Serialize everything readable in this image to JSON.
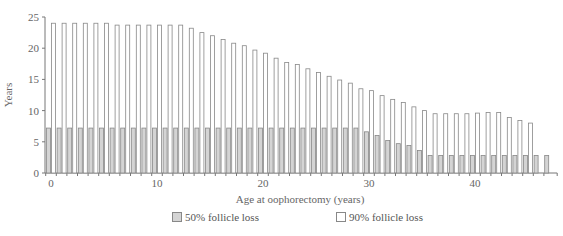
{
  "chart_data": {
    "type": "bar",
    "title": "",
    "xlabel": "Age at oophorectomy (years)",
    "ylabel": "Years",
    "ylim": [
      0,
      25
    ],
    "yticks": [
      0,
      5,
      10,
      15,
      20,
      25
    ],
    "xticks_labeled": [
      0,
      10,
      20,
      30,
      40
    ],
    "grid": false,
    "legend_position": "bottom",
    "categories": [
      0,
      1,
      2,
      3,
      4,
      5,
      6,
      7,
      8,
      9,
      10,
      11,
      12,
      13,
      14,
      15,
      16,
      17,
      18,
      19,
      20,
      21,
      22,
      23,
      24,
      25,
      26,
      27,
      28,
      29,
      30,
      31,
      32,
      33,
      34,
      35,
      36,
      37,
      38,
      39,
      40,
      41,
      42,
      43,
      44,
      45,
      46,
      47
    ],
    "series": [
      {
        "name": "50% follicle loss",
        "color": "#d4d4d4",
        "values": [
          7.2,
          7.2,
          7.2,
          7.2,
          7.2,
          7.2,
          7.2,
          7.2,
          7.2,
          7.2,
          7.2,
          7.2,
          7.2,
          7.2,
          7.2,
          7.2,
          7.2,
          7.2,
          7.2,
          7.2,
          7.2,
          7.2,
          7.2,
          7.2,
          7.2,
          7.2,
          7.2,
          7.2,
          7.2,
          7.2,
          6.6,
          6.0,
          5.2,
          4.7,
          4.4,
          3.6,
          2.8,
          2.8,
          2.8,
          2.8,
          2.8,
          2.8,
          2.8,
          2.8,
          2.8,
          2.8,
          2.8,
          2.8
        ]
      },
      {
        "name": "90% follicle loss",
        "color": "#ffffff",
        "values": [
          24.0,
          24.0,
          24.0,
          24.0,
          24.0,
          24.0,
          23.7,
          23.7,
          23.7,
          23.7,
          23.7,
          23.7,
          23.7,
          23.2,
          22.5,
          22.0,
          21.4,
          20.8,
          20.4,
          19.7,
          19.2,
          18.4,
          17.7,
          17.4,
          16.7,
          16.1,
          15.5,
          14.9,
          14.4,
          13.5,
          13.2,
          12.4,
          11.8,
          11.3,
          10.6,
          10.0,
          9.5,
          9.5,
          9.5,
          9.5,
          9.6,
          9.7,
          9.7,
          8.9,
          8.4,
          8.0,
          null,
          null
        ]
      }
    ]
  },
  "legend": {
    "items": [
      {
        "label": "50% follicle loss"
      },
      {
        "label": "90% follicle loss"
      }
    ]
  }
}
